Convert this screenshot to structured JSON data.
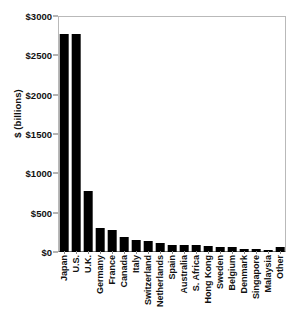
{
  "chart_data": {
    "type": "bar",
    "title": "",
    "subtitle": "",
    "xlabel": "",
    "ylabel": "$ (billions)",
    "ylim": [
      0,
      3000
    ],
    "ytick_values": [
      0,
      500,
      1000,
      1500,
      2000,
      2500,
      3000
    ],
    "ytick_labels": [
      "$0",
      "$500",
      "$1000",
      "$1500",
      "$2000",
      "$2500",
      "$3000"
    ],
    "grid": false,
    "legend": false,
    "bar_color": "#000000",
    "categories": [
      "Japan",
      "U.S.",
      "U.K.",
      "Germany",
      "France",
      "Canada",
      "Italy",
      "Switzerland",
      "Netherlands",
      "Spain",
      "Australia",
      "S. Africa",
      "Hong Kong",
      "Sweden",
      "Belgium",
      "Denmark",
      "Singapore",
      "Malaysia",
      "Other"
    ],
    "values": [
      2770,
      2770,
      770,
      300,
      275,
      195,
      150,
      145,
      115,
      95,
      95,
      90,
      80,
      70,
      60,
      40,
      35,
      30,
      65
    ]
  }
}
